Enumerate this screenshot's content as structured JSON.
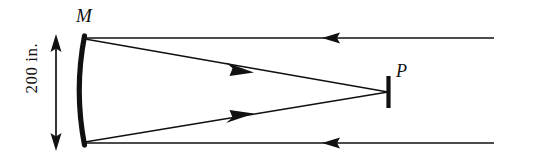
{
  "figure": {
    "type": "optics-ray-diagram",
    "background_color": "#ffffff",
    "stroke_color": "#111111",
    "width": 535,
    "height": 163,
    "labels": {
      "mirror": "M",
      "focus": "P",
      "dimension": "200 in."
    },
    "elements": {
      "mirror_name": "concave-mirror-arc",
      "focus_name": "focal-point-bar",
      "dimension_name": "aperture-dimension-arrow",
      "incoming_ray_top_name": "incoming-ray-top",
      "incoming_ray_bottom_name": "incoming-ray-bottom",
      "reflected_ray_top_name": "reflected-ray-top",
      "reflected_ray_bottom_name": "reflected-ray-bottom"
    },
    "geometry": {
      "mirror_top": [
        84,
        38
      ],
      "mirror_bottom": [
        84,
        143
      ],
      "mirror_vertex": [
        76,
        91
      ],
      "focus_point": [
        388,
        92
      ],
      "focus_bar_top": [
        388,
        77
      ],
      "focus_bar_bottom": [
        388,
        107
      ],
      "ray_right_edge": 494,
      "incoming_top_y": 38,
      "incoming_bottom_y": 143,
      "dimension_x": 56,
      "dimension_top_y": 36,
      "dimension_bottom_y": 149
    },
    "arrowheads": {
      "incoming_top": {
        "x": 328,
        "y": 38,
        "direction": "left"
      },
      "incoming_bottom": {
        "x": 328,
        "y": 143,
        "direction": "left"
      },
      "reflected_top": {
        "x": 243,
        "y": 69,
        "direction": "right-down"
      },
      "reflected_bottom": {
        "x": 243,
        "y": 117,
        "direction": "right-up"
      },
      "dimension_top": {
        "x": 56,
        "y": 36,
        "direction": "up"
      },
      "dimension_bottom": {
        "x": 56,
        "y": 149,
        "direction": "down"
      }
    }
  }
}
